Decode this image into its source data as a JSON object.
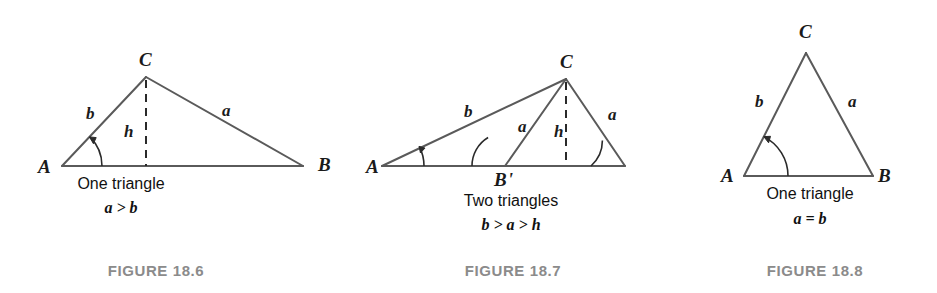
{
  "page": {
    "background_color": "#ffffff",
    "stroke_color": "#5a5a5a",
    "text_color": "#1a1a1a",
    "caption_color": "#8b8b8b",
    "width": 937,
    "height": 293
  },
  "figures": [
    {
      "id": "figure-18-6",
      "caption": "FIGURE 18.6",
      "description_line1": "One triangle",
      "description_line2": "a > b",
      "vertices": {
        "A": "A",
        "B": "B",
        "C": "C"
      },
      "sides": {
        "b": "b",
        "a": "a",
        "h": "h"
      },
      "geometry": {
        "A": [
          62,
          166
        ],
        "B": [
          303,
          166
        ],
        "C": [
          146,
          77
        ],
        "foot": [
          146,
          166
        ],
        "angle_arc_radius": 40
      }
    },
    {
      "id": "figure-18-7",
      "caption": "FIGURE 18.7",
      "description_line1": "Two triangles",
      "description_line2": "b > a > h",
      "vertices": {
        "A": "A",
        "B": "B",
        "Bprime": "B'",
        "C": "C"
      },
      "sides": {
        "b": "b",
        "a_inner": "a",
        "a_outer": "a",
        "h": "h"
      },
      "geometry": {
        "A": [
          382,
          166
        ],
        "B": [
          625,
          166
        ],
        "Bprime": [
          505,
          166
        ],
        "C": [
          566,
          79
        ],
        "foot": [
          566,
          166
        ],
        "angle_A_arc_radius": 42,
        "angle_Bprime_arc_radius": 33,
        "angle_B_arc_radius": 34
      }
    },
    {
      "id": "figure-18-8",
      "caption": "FIGURE 18.8",
      "description_line1": "One triangle",
      "description_line2": "a = b",
      "vertices": {
        "A": "A",
        "B": "B",
        "C": "C"
      },
      "sides": {
        "b": "b",
        "a": "a"
      },
      "geometry": {
        "A": [
          744,
          176
        ],
        "B": [
          873,
          176
        ],
        "C": [
          806,
          53
        ],
        "angle_arc_radius": 44
      }
    }
  ]
}
